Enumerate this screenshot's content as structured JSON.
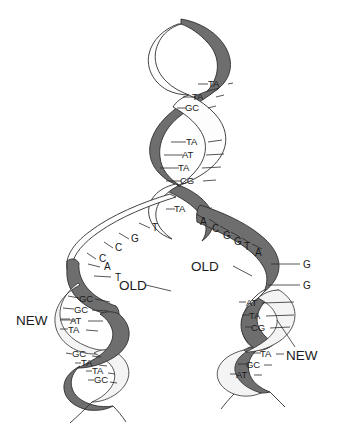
{
  "figure": {
    "labels": {
      "old_left": "OLD",
      "old_right": "OLD",
      "new_left": "NEW",
      "new_right": "NEW"
    },
    "colors": {
      "old_strand": "#6e6e6e",
      "new_strand": "#fdfdfd",
      "outline": "#2f2f2f",
      "text": "#1a1a1a",
      "background": "#ffffff"
    },
    "parent_helix": {
      "name": "parent-duplex",
      "base_pairs": [
        {
          "id": "p1",
          "left": "T",
          "right": "A",
          "text": "TA",
          "x": 213,
          "y": 84
        },
        {
          "id": "p2",
          "left": "T",
          "right": "A",
          "text": "TA",
          "x": 200,
          "y": 97
        },
        {
          "id": "p3",
          "left": "G",
          "right": "C",
          "text": "GC",
          "x": 193,
          "y": 108
        },
        {
          "id": "p4",
          "left": "T",
          "right": "A",
          "text": "TA",
          "x": 193,
          "y": 142
        },
        {
          "id": "p5",
          "left": "A",
          "right": "T",
          "text": "AT",
          "x": 190,
          "y": 155
        },
        {
          "id": "p6",
          "left": "T",
          "right": "A",
          "text": "TA",
          "x": 186,
          "y": 168
        },
        {
          "id": "p7",
          "left": "C",
          "right": "G",
          "text": "CG",
          "x": 188,
          "y": 181
        },
        {
          "id": "p8",
          "left": "T",
          "right": "A",
          "text": "TA",
          "x": 182,
          "y": 209
        }
      ]
    },
    "fork": {
      "left_arm_unpaired_bases": [
        {
          "base": "T",
          "x": 152,
          "y": 228
        },
        {
          "base": "G",
          "x": 131,
          "y": 238
        },
        {
          "base": "C",
          "x": 115,
          "y": 247
        },
        {
          "base": "C",
          "x": 99,
          "y": 258
        },
        {
          "base": "A",
          "x": 104,
          "y": 266
        },
        {
          "base": "T",
          "x": 115,
          "y": 277
        }
      ],
      "right_arm_unpaired_bases": [
        {
          "base": "A",
          "x": 203,
          "y": 223
        },
        {
          "base": "C",
          "x": 215,
          "y": 229
        },
        {
          "base": "G",
          "x": 225,
          "y": 236
        },
        {
          "base": "G",
          "x": 236,
          "y": 241
        },
        {
          "base": "T",
          "x": 245,
          "y": 246
        },
        {
          "base": "A",
          "x": 256,
          "y": 252
        }
      ]
    },
    "left_daughter_helix": {
      "name": "left-daughter-duplex",
      "base_pairs": [
        {
          "text": "GC",
          "x": 81,
          "y": 299
        },
        {
          "text": "GC",
          "x": 76,
          "y": 310
        },
        {
          "text": "AT",
          "x": 72,
          "y": 321
        },
        {
          "text": "TA",
          "x": 70,
          "y": 330
        },
        {
          "text": "GC",
          "x": 74,
          "y": 355
        },
        {
          "text": "TA",
          "x": 83,
          "y": 364
        },
        {
          "text": "TA",
          "x": 94,
          "y": 372
        },
        {
          "text": "GC",
          "x": 96,
          "y": 381
        }
      ]
    },
    "right_daughter_helix": {
      "name": "right-daughter-duplex",
      "unpaired_bases": [
        {
          "base": "G",
          "x": 307,
          "y": 266
        },
        {
          "base": "G",
          "x": 307,
          "y": 287
        }
      ],
      "base_pairs": [
        {
          "text": "AT",
          "x": 247,
          "y": 304
        },
        {
          "text": "TA",
          "x": 251,
          "y": 317
        },
        {
          "text": "CG",
          "x": 253,
          "y": 329
        },
        {
          "text": "TA",
          "x": 262,
          "y": 355
        },
        {
          "text": "GC",
          "x": 249,
          "y": 366
        },
        {
          "text": "AT",
          "x": 239,
          "y": 376
        }
      ]
    }
  }
}
